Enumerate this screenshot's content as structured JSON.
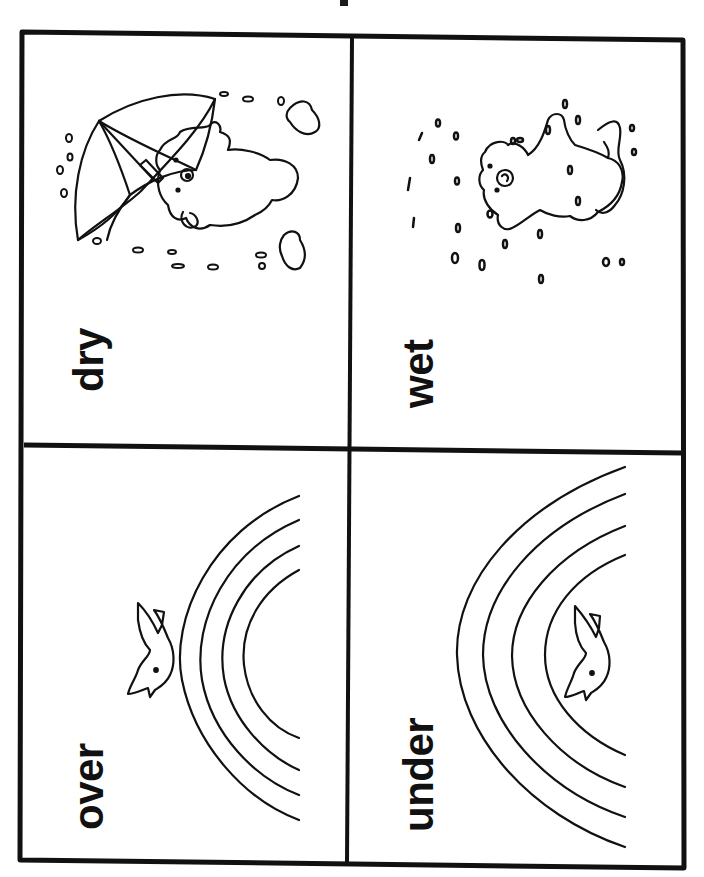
{
  "worksheet": {
    "type": "opposites-flash-cards",
    "orientation": "rotated-90-ccw",
    "colors": {
      "ink": "#111111",
      "paper": "#ffffff"
    },
    "cards": [
      {
        "id": "dry",
        "word": "dry",
        "position": "top-left",
        "illustration": "bear-with-umbrella-in-rain"
      },
      {
        "id": "wet",
        "word": "wet",
        "position": "top-right",
        "illustration": "bear-in-rain-puddle"
      },
      {
        "id": "over",
        "word": "over",
        "position": "bottom-left",
        "illustration": "bird-over-rainbow"
      },
      {
        "id": "under",
        "word": "under",
        "position": "bottom-right",
        "illustration": "bird-under-rainbow"
      }
    ]
  }
}
